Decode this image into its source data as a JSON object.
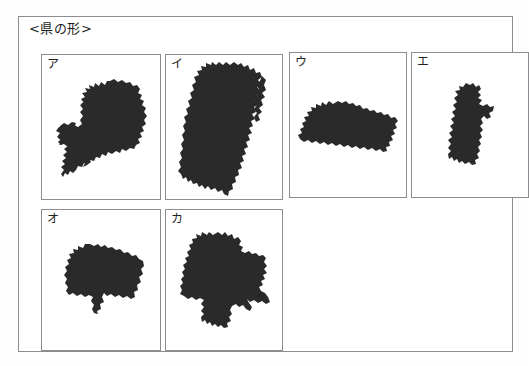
{
  "sheet": {
    "title": "<県の形>",
    "frame_color": "#8d8d90",
    "shape_color": "#2a2a2a",
    "background_color": "#ffffff"
  },
  "panels": [
    {
      "id": "panel-a",
      "label": "ア",
      "shape_name": "gifu-prefecture-silhouette",
      "x": 22,
      "y": 37,
      "w": 120,
      "h": 146,
      "shape_x": 14,
      "shape_y": 24,
      "shape_w": 94,
      "shape_h": 108
    },
    {
      "id": "panel-i",
      "label": "イ",
      "shape_name": "nagano-prefecture-silhouette",
      "x": 146,
      "y": 37,
      "w": 118,
      "h": 146,
      "shape_x": 12,
      "shape_y": 7,
      "shape_w": 88,
      "shape_h": 135
    },
    {
      "id": "panel-u",
      "label": "ウ",
      "shape_name": "yamanashi-prefecture-silhouette",
      "x": 270,
      "y": 35,
      "w": 118,
      "h": 146,
      "shape_x": 8,
      "shape_y": 48,
      "shape_w": 100,
      "shape_h": 52
    },
    {
      "id": "panel-e",
      "label": "エ",
      "shape_name": "fukui-prefecture-silhouette",
      "x": 392,
      "y": 35,
      "w": 118,
      "h": 146,
      "shape_x": 34,
      "shape_y": 30,
      "shape_w": 48,
      "shape_h": 82
    },
    {
      "id": "panel-o",
      "label": "オ",
      "shape_name": "toyama-prefecture-silhouette",
      "x": 22,
      "y": 192,
      "w": 120,
      "h": 142,
      "shape_x": 22,
      "shape_y": 34,
      "shape_w": 80,
      "shape_h": 70
    },
    {
      "id": "panel-ka",
      "label": "カ",
      "shape_name": "gunma-prefecture-silhouette",
      "x": 146,
      "y": 192,
      "w": 118,
      "h": 142,
      "shape_x": 14,
      "shape_y": 22,
      "shape_w": 90,
      "shape_h": 96
    }
  ]
}
